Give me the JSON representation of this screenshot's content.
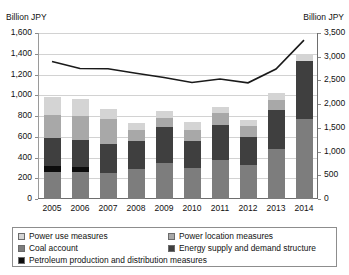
{
  "axes": {
    "left_unit": "Billion JPY",
    "right_unit": "Billion JPY",
    "left_ticks": [
      "1,600",
      "1,400",
      "1,200",
      "1,000",
      "800",
      "600",
      "400",
      "200",
      "0"
    ],
    "right_ticks": [
      "3,500",
      "3,000",
      "2,500",
      "2,000",
      "1,500",
      "1,000",
      "500",
      "0"
    ],
    "x_labels": [
      "2005",
      "2006",
      "2007",
      "2008",
      "2009",
      "2010",
      "2011",
      "2012",
      "2013",
      "2014"
    ]
  },
  "legend": {
    "items": [
      {
        "label": "Power use measures",
        "color": "#d4d4d4"
      },
      {
        "label": "Power location measures",
        "color": "#a8a8a8"
      },
      {
        "label": "Coal account",
        "color": "#7d7d7d"
      },
      {
        "label": "Energy supply and demand structure",
        "color": "#3f3f3f"
      },
      {
        "label": "Petroleum production and distribution measures",
        "color": "#0d0d0d"
      }
    ]
  },
  "chart_data": {
    "type": "bar",
    "title": "",
    "xlabel": "",
    "ylabel": "Billion JPY",
    "ylim": [
      0,
      1600
    ],
    "y2lim": [
      0,
      3500
    ],
    "ytick_step": 200,
    "y2tick_step": 500,
    "grid": true,
    "legend_position": "bottom",
    "categories": [
      "2005",
      "2006",
      "2007",
      "2008",
      "2009",
      "2010",
      "2011",
      "2012",
      "2013",
      "2014"
    ],
    "series": [
      {
        "name": "Power use measures",
        "axis": "left",
        "kind": "bar",
        "values": [
          170,
          155,
          100,
          60,
          70,
          75,
          60,
          60,
          70,
          70
        ]
      },
      {
        "name": "Power location measures",
        "axis": "left",
        "kind": "bar",
        "values": [
          220,
          240,
          240,
          110,
          90,
          110,
          120,
          100,
          100,
          0
        ]
      },
      {
        "name": "Coal account",
        "axis": "left",
        "kind": "bar",
        "values": [
          0,
          0,
          0,
          0,
          0,
          0,
          0,
          0,
          0,
          0
        ]
      },
      {
        "name": "Energy supply and demand structure",
        "axis": "left",
        "kind": "bar",
        "values": [
          270,
          255,
          280,
          270,
          340,
          260,
          330,
          270,
          375,
          560
        ]
      },
      {
        "name": "Petroleum production and distribution measures",
        "axis": "left",
        "kind": "bar",
        "values": [
          60,
          50,
          0,
          0,
          0,
          0,
          0,
          0,
          0,
          0
        ]
      },
      {
        "name": "Remaining account (base)",
        "axis": "left",
        "kind": "bar",
        "values": [
          260,
          260,
          250,
          290,
          350,
          300,
          380,
          330,
          480,
          770
        ]
      },
      {
        "name": "Total (right axis)",
        "axis": "right",
        "kind": "line",
        "values": [
          2900,
          2750,
          2745,
          2650,
          2560,
          2455,
          2530,
          2450,
          2740,
          3350
        ]
      }
    ],
    "bar_totals": [
      980,
      960,
      870,
      730,
      850,
      745,
      890,
      760,
      1025,
      1400
    ]
  }
}
